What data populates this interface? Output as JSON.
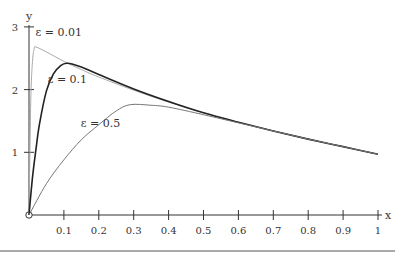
{
  "chart_data": {
    "type": "line",
    "title": "",
    "xlabel": "x",
    "ylabel": "y",
    "xlim": [
      0,
      1
    ],
    "ylim": [
      0,
      3
    ],
    "grid": false,
    "legend": "inline curve labels",
    "x_ticks": [
      "0.1",
      "0.2",
      "0.3",
      "0.4",
      "0.5",
      "0.6",
      "0.7",
      "0.8",
      "0.9",
      "1"
    ],
    "y_ticks": [
      "1",
      "2",
      "3"
    ],
    "series": [
      {
        "name": "ε = 0.01",
        "color": "#aaaaaa",
        "width": 1,
        "label_pos": [
          0.01,
          2.85
        ],
        "x": [
          0,
          0.005,
          0.01,
          0.015,
          0.02,
          0.05,
          0.1,
          0.15,
          0.2,
          0.3,
          0.4,
          0.5,
          0.6,
          0.7,
          0.8,
          0.9,
          1.0
        ],
        "y": [
          0,
          1.8,
          2.45,
          2.65,
          2.68,
          2.6,
          2.45,
          2.32,
          2.2,
          1.99,
          1.8,
          1.63,
          1.48,
          1.34,
          1.21,
          1.09,
          0.97
        ]
      },
      {
        "name": "ε = 0.1",
        "color": "#222222",
        "width": 1.6,
        "label_pos": [
          0.045,
          2.1
        ],
        "x": [
          0,
          0.01,
          0.02,
          0.03,
          0.05,
          0.07,
          0.09,
          0.11,
          0.15,
          0.2,
          0.3,
          0.4,
          0.5,
          0.6,
          0.7,
          0.8,
          0.9,
          1.0
        ],
        "y": [
          0,
          0.6,
          1.05,
          1.45,
          1.98,
          2.25,
          2.38,
          2.42,
          2.36,
          2.24,
          2.01,
          1.81,
          1.63,
          1.48,
          1.34,
          1.21,
          1.09,
          0.97
        ]
      },
      {
        "name": "ε = 0.5",
        "color": "#777777",
        "width": 1,
        "label_pos": [
          0.14,
          1.4
        ],
        "x": [
          0,
          0.05,
          0.1,
          0.15,
          0.2,
          0.25,
          0.29,
          0.35,
          0.4,
          0.5,
          0.6,
          0.7,
          0.8,
          0.9,
          1.0
        ],
        "y": [
          0,
          0.5,
          0.88,
          1.2,
          1.44,
          1.66,
          1.76,
          1.75,
          1.72,
          1.6,
          1.47,
          1.34,
          1.21,
          1.09,
          0.97
        ]
      }
    ]
  },
  "axes": {
    "x_label": "x",
    "y_label": "y",
    "origin_marker": "open-circle"
  }
}
